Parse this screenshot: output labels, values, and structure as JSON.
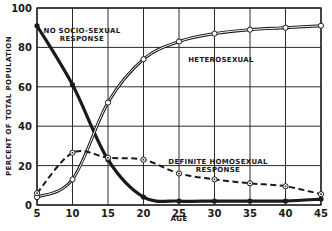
{
  "chart_data": {
    "type": "line",
    "title": "",
    "xlabel": "AGE",
    "ylabel": "PERCENT OF TOTAL POPULATION",
    "x": [
      5,
      10,
      15,
      20,
      25,
      30,
      35,
      40,
      45
    ],
    "xlim": [
      5,
      45
    ],
    "ylim": [
      0,
      100
    ],
    "xticks": [
      5,
      10,
      15,
      20,
      25,
      30,
      35,
      40,
      45
    ],
    "yticks": [
      0,
      20,
      40,
      60,
      80,
      100
    ],
    "grid": true,
    "series": [
      {
        "name": "NO SOCIO-SEXUAL RESPONSE",
        "label_lines": [
          "NO SOCIO-SEXUAL",
          "RESPONSE"
        ],
        "style": "thick-solid",
        "marker": "filled-circle",
        "values": [
          91,
          61,
          23,
          4,
          2,
          2,
          2,
          2,
          3
        ]
      },
      {
        "name": "HETEROSEXUAL",
        "label_lines": [
          "HETEROSEXUAL"
        ],
        "style": "double-line",
        "marker": "open-circle",
        "values": [
          4,
          13,
          52,
          74,
          83,
          87,
          89,
          90,
          91
        ]
      },
      {
        "name": "DEFINITE HOMOSEXUAL RESPONSE",
        "label_lines": [
          "DEFINITE HOMOSEXUAL",
          "RESPONSE"
        ],
        "style": "dashed",
        "marker": "dotted-circle",
        "values": [
          6,
          26.5,
          24,
          23,
          16,
          13,
          11,
          9.5,
          5.5
        ]
      }
    ],
    "colors": {
      "ink": "#1a1a1a",
      "grid": "#2a2a2a",
      "background": "#ffffff"
    }
  }
}
